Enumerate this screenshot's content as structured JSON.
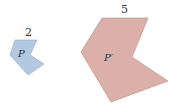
{
  "figure": {
    "small_polygon": {
      "name": "P",
      "side_label": "2",
      "fill": "#b4c8e2",
      "stroke": "#8fa7c6",
      "points": "15,40 37,40 30,55 44,64 28,75 10,55"
    },
    "large_polygon": {
      "name": "P′",
      "side_label": "5",
      "fill": "#dbb0a8",
      "stroke": "#b98d85",
      "points": "102,18 148,18 132,57 168,81 111,102 81,52"
    }
  }
}
